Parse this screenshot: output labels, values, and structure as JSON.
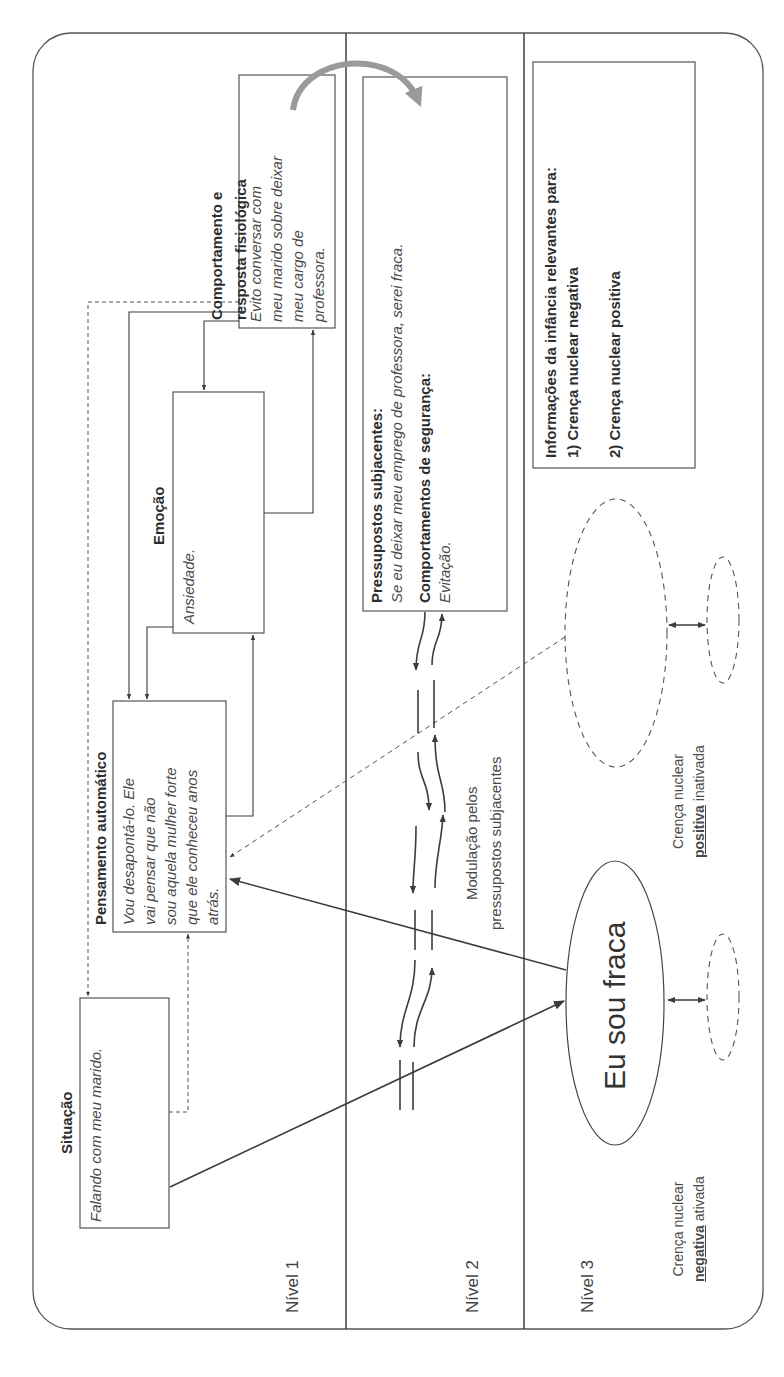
{
  "levels": {
    "level1": "Nível 1",
    "level2": "Nível 2",
    "level3": "Nível 3"
  },
  "situation": {
    "title": "Situação",
    "text": "Falando com meu marido."
  },
  "automatic_thought": {
    "title": "Pensamento automático",
    "lines": [
      "Vou desapontá-lo. Ele",
      "vai pensar que não",
      "sou aquela mulher forte",
      "que ele conheceu anos",
      "atrás."
    ]
  },
  "emotion": {
    "title": "Emoção",
    "text": "Ansiedade."
  },
  "behavior": {
    "title_line1": "Comportamento e",
    "title_line2": "resposta fisiológica",
    "lines": [
      "Evito conversar com",
      "meu marido sobre deixar",
      "meu cargo de",
      "professora."
    ]
  },
  "underlying_assumptions": {
    "title": "Pressupostos subjacentes:",
    "text": "Se eu deixar meu emprego de professora, serei fraca.",
    "safety_title": "Comportamentos de segurança:",
    "safety_text": "Evitação."
  },
  "modulation": {
    "line1": "Modulação pelos",
    "line2": "pressupostos subjacentes"
  },
  "childhood_info": {
    "title": "Informações da infância relevantes para:",
    "item1": "1) Crença nuclear negativa",
    "item2": "2) Crença nuclear positiva"
  },
  "core_belief_negative": {
    "text": "Eu sou fraca",
    "caption_line1": "Crença nuclear",
    "caption_emph": "negativa",
    "caption_rest": " ativada"
  },
  "core_belief_positive": {
    "caption_line1": "Crença nuclear",
    "caption_emph": "positiva",
    "caption_rest": " inativada"
  },
  "colors": {
    "line": "#3c3c3c",
    "curved_arrow": "#9a9a9a",
    "background": "#ffffff"
  }
}
